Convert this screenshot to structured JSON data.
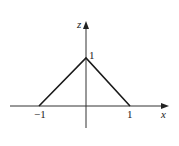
{
  "diagram": {
    "type": "function-graph",
    "axes": {
      "horizontal": {
        "label": "x"
      },
      "vertical": {
        "label": "z"
      }
    },
    "ticks": {
      "x_neg_one": "−1",
      "x_pos_one": "1",
      "z_one": "1"
    },
    "curve": {
      "description": "tent function z = 1 - |x| on [-1, 1]",
      "points": [
        [
          -1,
          0
        ],
        [
          0,
          1
        ],
        [
          1,
          0
        ]
      ]
    },
    "colors": {
      "axis": "#333333",
      "curve": "#1a1a1a",
      "background": "#ffffff"
    }
  }
}
